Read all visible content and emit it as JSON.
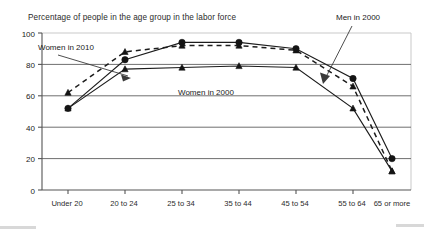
{
  "chart_data": {
    "type": "line",
    "title": "Percentage of people in the age group in the labor force",
    "xlabel": "",
    "ylabel": "",
    "ylim": [
      0,
      100
    ],
    "yticks": [
      0,
      20,
      40,
      60,
      80,
      100
    ],
    "grid": true,
    "legend_position": "inline-annotations",
    "categories": [
      "Under 20",
      "20 to 24",
      "25 to 34",
      "35 to 44",
      "45 to 54",
      "55 to 64",
      "65 or more"
    ],
    "series": [
      {
        "name": "Men in 2000",
        "marker": "circle",
        "line_style": "solid",
        "values": [
          52,
          83,
          94,
          94,
          90,
          71,
          20
        ]
      },
      {
        "name": "Women in 2010",
        "marker": "triangle",
        "line_style": "dashed",
        "values": [
          62,
          88,
          92,
          92,
          89,
          66,
          12
        ]
      },
      {
        "name": "Women in 2000",
        "marker": "triangle",
        "line_style": "solid",
        "values": [
          52,
          77,
          78,
          79,
          78,
          52,
          12
        ]
      }
    ],
    "annotations": [
      {
        "label": "Women in 2010",
        "x": 38,
        "y": 47,
        "arrow_to_x": 133,
        "arrow_to_y": 79
      },
      {
        "label": "Women in 2000",
        "x": 178,
        "y": 92,
        "arrow_to_x": null,
        "arrow_to_y": null
      },
      {
        "label": "Men in 2000",
        "x": 337,
        "y": 20,
        "arrow_to_x": 325,
        "arrow_to_y": 84
      }
    ]
  }
}
